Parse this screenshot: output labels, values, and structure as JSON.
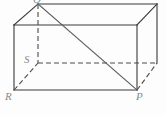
{
  "figure": {
    "name": "rectangular-prism",
    "width": 166,
    "height": 115,
    "background_color": "#fdfdfd",
    "edge_color": "#3a3a3a",
    "hidden_edge_color": "#4a4a4a",
    "diagonal_color": "#5a5a5a",
    "label_color": "#8a8a8a",
    "edge_width": 1.1,
    "hidden_dash_pattern": "5,3"
  },
  "labels": {
    "r": "R",
    "p": "P",
    "s": "S",
    "q": "Q"
  },
  "vertices": {
    "front_top_left": {
      "x": 14,
      "y": 25
    },
    "front_top_right": {
      "x": 137,
      "y": 25
    },
    "front_bottom_left": {
      "x": 14,
      "y": 90
    },
    "front_bottom_right": {
      "x": 137,
      "y": 90
    },
    "back_top_left": {
      "x": 38,
      "y": 4
    },
    "back_top_right": {
      "x": 157,
      "y": 4
    },
    "back_bottom_left": {
      "x": 38,
      "y": 63
    },
    "back_bottom_right": {
      "x": 157,
      "y": 63
    }
  },
  "edges": {
    "solid": [
      {
        "name": "front-top",
        "x1": 14,
        "y1": 25,
        "x2": 137,
        "y2": 25
      },
      {
        "name": "front-bottom",
        "x1": 14,
        "y1": 90,
        "x2": 137,
        "y2": 90
      },
      {
        "name": "front-left",
        "x1": 14,
        "y1": 25,
        "x2": 14,
        "y2": 90
      },
      {
        "name": "front-right",
        "x1": 137,
        "y1": 25,
        "x2": 137,
        "y2": 90
      },
      {
        "name": "back-top",
        "x1": 38,
        "y1": 4,
        "x2": 157,
        "y2": 4
      },
      {
        "name": "back-right",
        "x1": 157,
        "y1": 4,
        "x2": 157,
        "y2": 63
      },
      {
        "name": "top-left-connector",
        "x1": 14,
        "y1": 25,
        "x2": 38,
        "y2": 4
      },
      {
        "name": "top-right-connector",
        "x1": 137,
        "y1": 25,
        "x2": 157,
        "y2": 4
      }
    ],
    "dashed": [
      {
        "name": "back-left-vertical",
        "x1": 38,
        "y1": 4,
        "x2": 38,
        "y2": 63
      },
      {
        "name": "back-bottom",
        "x1": 38,
        "y1": 63,
        "x2": 157,
        "y2": 63
      },
      {
        "name": "bottom-left-connector",
        "x1": 14,
        "y1": 90,
        "x2": 38,
        "y2": 63
      },
      {
        "name": "bottom-right-connector",
        "x1": 137,
        "y1": 90,
        "x2": 157,
        "y2": 63
      }
    ],
    "diagonal": [
      {
        "name": "space-diagonal",
        "x1": 38,
        "y1": 4,
        "x2": 137,
        "y2": 90
      }
    ]
  }
}
